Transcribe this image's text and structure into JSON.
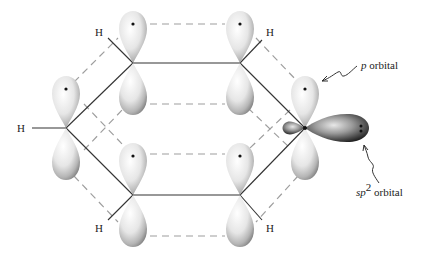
{
  "diagram": {
    "labels": {
      "h_top_left": "H",
      "h_top_right": "H",
      "h_left": "H",
      "h_bottom_left": "H",
      "h_bottom_right": "H",
      "p_orbital_prefix": "p",
      "p_orbital_suffix": " orbital",
      "sp2_prefix": "sp",
      "sp2_superscript": "2",
      "sp2_suffix": " orbital"
    },
    "carbons": [
      {
        "id": "c1",
        "x": 133,
        "y": 63
      },
      {
        "id": "c2",
        "x": 240,
        "y": 63
      },
      {
        "id": "c3",
        "x": 305,
        "y": 128
      },
      {
        "id": "c4",
        "x": 240,
        "y": 195
      },
      {
        "id": "c5",
        "x": 133,
        "y": 195
      },
      {
        "id": "c6",
        "x": 66,
        "y": 128
      }
    ],
    "colors": {
      "bond": "#333333",
      "dashed": "#9a9a9a",
      "orbital_light": "#f2f2f2",
      "orbital_dark": "#8a8a8a",
      "sp2_dark": "#2a2a2a"
    }
  }
}
